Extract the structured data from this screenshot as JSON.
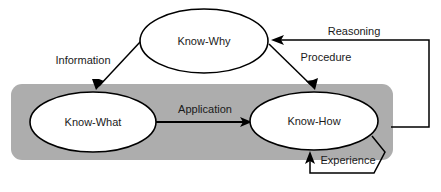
{
  "diagram": {
    "colors": {
      "group_background": "#adadad",
      "node_fill": "#ffffff",
      "stroke": "#000000",
      "text": "#1a1a1a"
    },
    "group": {
      "name": "knowledge-application-group",
      "label": ""
    },
    "nodes": [
      {
        "id": "know-why",
        "label": "Know-Why",
        "cx": 204,
        "cy": 41,
        "rx": 64,
        "ry": 32
      },
      {
        "id": "know-what",
        "label": "Know-What",
        "cx": 93,
        "cy": 122,
        "rx": 63,
        "ry": 30
      },
      {
        "id": "know-how",
        "label": "Know-How",
        "cx": 314,
        "cy": 121,
        "rx": 64,
        "ry": 29
      }
    ],
    "edges": [
      {
        "id": "information",
        "label": "Information",
        "from": "know-why",
        "to": "know-what",
        "label_x": 83,
        "label_y": 61
      },
      {
        "id": "procedure",
        "label": "Procedure",
        "from": "know-why",
        "to": "know-how",
        "label_x": 326,
        "label_y": 58
      },
      {
        "id": "application",
        "label": "Application",
        "from": "know-what",
        "to": "know-how",
        "label_x": 205,
        "label_y": 110
      },
      {
        "id": "reasoning",
        "label": "Reasoning",
        "from": "know-how",
        "to": "know-why",
        "label_x": 354,
        "label_y": 32
      },
      {
        "id": "experience",
        "label": "Experience",
        "from": "know-how",
        "to": "know-how",
        "label_x": 348,
        "label_y": 161
      }
    ]
  }
}
